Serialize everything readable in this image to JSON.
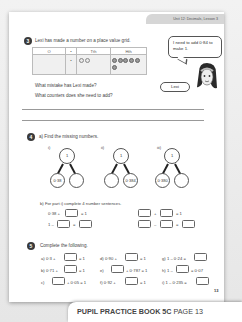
{
  "header": {
    "unit_label": "Unit 12: Decimals, Lesson 3"
  },
  "q3": {
    "number": "3",
    "prompt": "Lexi has made a number on a place value grid.",
    "grid": {
      "headers": [
        "O",
        "•",
        "Tth",
        "Hth"
      ],
      "row": {
        "O": "",
        "point": "•",
        "Tth_counters": 2,
        "Hth_counters": 6
      }
    },
    "speech": "I need to add 0·84 to make 1.",
    "character_name": "Lexi",
    "question_1": "What mistake has Lexi made?",
    "question_2": "What counters does she need to add?"
  },
  "q4": {
    "number": "4",
    "part_a": "a) Find the missing numbers.",
    "part_models": [
      {
        "label": "i)",
        "whole": "1",
        "left": "0·38",
        "right": ""
      },
      {
        "label": "ii)",
        "whole": "1",
        "left": "",
        "right": "0·384"
      },
      {
        "label": "iii)",
        "whole": "1",
        "left": "0·380",
        "right": ""
      }
    ],
    "part_b": "b) For part i) complete 4 number sentences.",
    "sentences": {
      "s1_lhs": "0·38 +",
      "s1_eq": "= 1",
      "s2_lhs": "1 –",
      "s2_eq": "=",
      "s3_plus": "+",
      "s3_eq": "= 1",
      "s4_minus": "–",
      "s4_eq": "="
    }
  },
  "q5": {
    "number": "5",
    "prompt": "Complete the following.",
    "items": {
      "a_pre": "a)  0·3 +",
      "a_post": "= 1",
      "b_pre": "b)  0·71 +",
      "b_post": "= 1",
      "c_pre": "c)",
      "c_post": "+ 0·05 = 1",
      "d_pre": "d) 0·90 +",
      "d_post": "= 1",
      "e_pre": "e)",
      "e_post": "+ 0·787 = 1",
      "f_pre": "f)  0·92 +",
      "f_post": "= 1",
      "g_pre": "g) 1 – 0·24 =",
      "h_pre": "h) 1 –",
      "h_post": "= 0·07",
      "i_pre": "i)  1 – 0·235 ="
    }
  },
  "page_number": "13",
  "footer": {
    "book": "PUPIL PRACTICE BOOK 5C",
    "page": "PAGE 13"
  }
}
